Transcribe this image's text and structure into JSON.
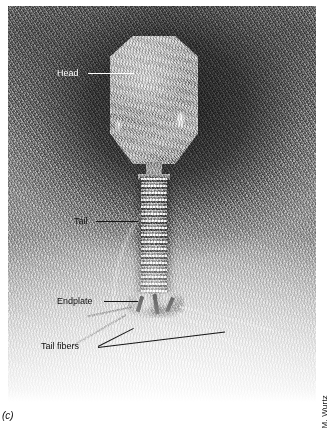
{
  "figure": {
    "panel_label": "(c)",
    "credit": "M. Wurtz"
  },
  "annotations": [
    {
      "id": "head",
      "label": "Head",
      "style": "light",
      "x": 57,
      "y": 68,
      "line_x": 88,
      "line_y": 73,
      "line_len": 46,
      "line_angle": 0
    },
    {
      "id": "tail",
      "label": "Tail",
      "style": "dark",
      "x": 74,
      "y": 216,
      "line_x": 96,
      "line_y": 221,
      "line_len": 42,
      "line_angle": 0
    },
    {
      "id": "endplate",
      "label": "Endplate",
      "style": "dark",
      "x": 57,
      "y": 296,
      "line_x": 104,
      "line_y": 301,
      "line_len": 34,
      "line_angle": 0
    },
    {
      "id": "tail-fibers",
      "label": "Tail fibers",
      "style": "dark",
      "x": 41,
      "y": 341,
      "line_x": 98,
      "line_y": 346,
      "line_len": 40,
      "line_angle": -27
    },
    {
      "id": "tail-fibers-2",
      "label": "",
      "style": "dark",
      "x": 0,
      "y": 0,
      "line_x": 98,
      "line_y": 347,
      "line_len": 128,
      "line_angle": -7
    }
  ],
  "structures": [
    {
      "name": "head",
      "description": "elongated icosahedral capsid"
    },
    {
      "name": "tail",
      "description": "striated contractile tail sheath"
    },
    {
      "name": "endplate",
      "description": "dark baseplate mass"
    },
    {
      "name": "tail-fibers",
      "description": "thin fibers radiating from baseplate"
    }
  ],
  "colors": {
    "label_light": "#ffffff",
    "label_dark": "#111111",
    "plate_background": "#8d8d8d"
  }
}
